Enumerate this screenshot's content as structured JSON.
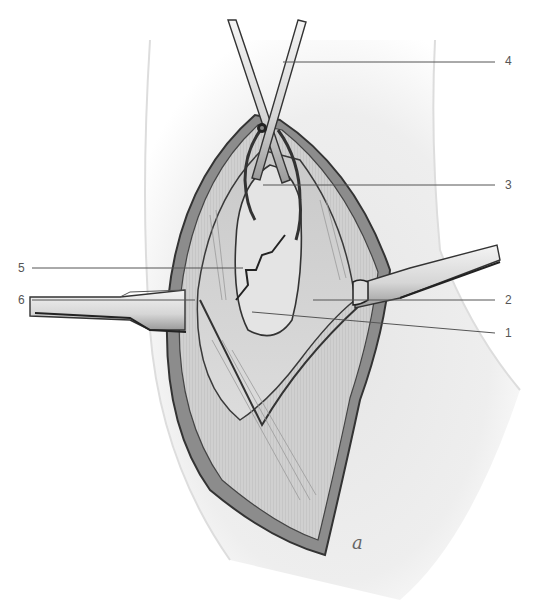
{
  "figure": {
    "colors": {
      "ink": "#333333",
      "tissue_light": "#e8e8e8",
      "tissue_mid": "#bdbdbd",
      "skin": "#f2f2f2",
      "leader_line": "#555555"
    },
    "callouts": [
      {
        "number": "4",
        "label_x": 505,
        "label_y": 55
      },
      {
        "number": "3",
        "label_x": 505,
        "label_y": 180
      },
      {
        "number": "5",
        "label_x": 18,
        "label_y": 262
      },
      {
        "number": "6",
        "label_x": 18,
        "label_y": 294
      },
      {
        "number": "2",
        "label_x": 505,
        "label_y": 294
      },
      {
        "number": "1",
        "label_x": 505,
        "label_y": 328
      }
    ],
    "signature": "a"
  }
}
